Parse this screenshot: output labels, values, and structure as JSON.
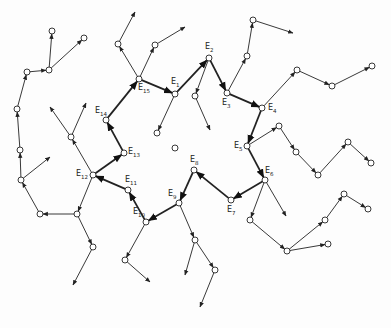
{
  "diagram": {
    "type": "directed-graph",
    "colors": {
      "background": "#fdfdfd",
      "stroke": "#222222",
      "node_fill": "#ffffff"
    },
    "labeled_nodes": [
      {
        "id": "E1",
        "label": "E",
        "sub": "1",
        "x": 175,
        "y": 94,
        "lx": 171,
        "ly": 78
      },
      {
        "id": "E2",
        "label": "E",
        "sub": "2",
        "x": 209,
        "y": 58,
        "lx": 205,
        "ly": 43
      },
      {
        "id": "E3",
        "label": "E",
        "sub": "3",
        "x": 227,
        "y": 93,
        "lx": 222,
        "ly": 99
      },
      {
        "id": "E4",
        "label": "E",
        "sub": "4",
        "x": 262,
        "y": 108,
        "lx": 268,
        "ly": 104
      },
      {
        "id": "E5",
        "label": "E",
        "sub": "5",
        "x": 247,
        "y": 146,
        "lx": 234,
        "ly": 142
      },
      {
        "id": "E6",
        "label": "E",
        "sub": "6",
        "x": 265,
        "y": 180,
        "lx": 265,
        "ly": 167
      },
      {
        "id": "E7",
        "label": "E",
        "sub": "7",
        "x": 231,
        "y": 200,
        "lx": 227,
        "ly": 206
      },
      {
        "id": "E8",
        "label": "E",
        "sub": "8",
        "x": 194,
        "y": 170,
        "lx": 190,
        "ly": 156
      },
      {
        "id": "E9",
        "label": "E",
        "sub": "9",
        "x": 179,
        "y": 203,
        "lx": 168,
        "ly": 190
      },
      {
        "id": "E10",
        "label": "E",
        "sub": "10",
        "x": 146,
        "y": 222,
        "lx": 133,
        "ly": 208
      },
      {
        "id": "E11",
        "label": "E",
        "sub": "11",
        "x": 128,
        "y": 190,
        "lx": 125,
        "ly": 176
      },
      {
        "id": "E12",
        "label": "E",
        "sub": "12",
        "x": 93,
        "y": 175,
        "lx": 76,
        "ly": 170
      },
      {
        "id": "E13",
        "label": "E",
        "sub": "13",
        "x": 124,
        "y": 153,
        "lx": 128,
        "ly": 148
      },
      {
        "id": "E14",
        "label": "E",
        "sub": "14",
        "x": 106,
        "y": 120,
        "lx": 95,
        "ly": 107
      },
      {
        "id": "E15",
        "label": "E",
        "sub": "15",
        "x": 139,
        "y": 79,
        "lx": 138,
        "ly": 84
      }
    ],
    "main_path": [
      "E15",
      "E1",
      "E2",
      "E3",
      "E4",
      "E5",
      "E6",
      "E7",
      "E8",
      "E9",
      "E10",
      "E11",
      "E12",
      "E13",
      "E14",
      "E15"
    ],
    "nodes": [
      [
        118,
        44
      ],
      [
        155,
        45
      ],
      [
        157,
        133
      ],
      [
        195,
        96
      ],
      [
        247,
        56
      ],
      [
        253,
        20
      ],
      [
        297,
        70
      ],
      [
        332,
        86
      ],
      [
        372,
        66
      ],
      [
        279,
        126
      ],
      [
        296,
        152
      ],
      [
        318,
        175
      ],
      [
        348,
        142
      ],
      [
        371,
        163
      ],
      [
        250,
        220
      ],
      [
        287,
        251
      ],
      [
        328,
        244
      ],
      [
        325,
        220
      ],
      [
        344,
        194
      ],
      [
        368,
        209
      ],
      [
        195,
        240
      ],
      [
        215,
        270
      ],
      [
        125,
        260
      ],
      [
        77,
        214
      ],
      [
        93,
        247
      ],
      [
        40,
        214
      ],
      [
        21,
        180
      ],
      [
        20,
        150
      ],
      [
        17,
        109
      ],
      [
        27,
        72
      ],
      [
        49,
        70
      ],
      [
        52,
        31
      ],
      [
        84,
        38
      ],
      [
        71,
        137
      ],
      [
        175,
        148
      ]
    ],
    "thin_edges": [
      [
        139,
        79,
        118,
        44
      ],
      [
        118,
        44,
        135,
        12
      ],
      [
        139,
        79,
        155,
        45
      ],
      [
        155,
        45,
        185,
        27
      ],
      [
        175,
        94,
        157,
        133
      ],
      [
        209,
        58,
        195,
        96
      ],
      [
        195,
        96,
        210,
        130
      ],
      [
        227,
        93,
        247,
        56
      ],
      [
        247,
        56,
        253,
        20
      ],
      [
        253,
        20,
        293,
        33
      ],
      [
        262,
        108,
        297,
        70
      ],
      [
        297,
        70,
        332,
        86
      ],
      [
        332,
        86,
        372,
        66
      ],
      [
        247,
        146,
        279,
        126
      ],
      [
        279,
        126,
        296,
        152
      ],
      [
        296,
        152,
        318,
        175
      ],
      [
        318,
        175,
        348,
        142
      ],
      [
        348,
        142,
        371,
        163
      ],
      [
        265,
        180,
        250,
        220
      ],
      [
        250,
        220,
        287,
        251
      ],
      [
        287,
        251,
        328,
        244
      ],
      [
        287,
        251,
        325,
        220
      ],
      [
        325,
        220,
        344,
        194
      ],
      [
        344,
        194,
        368,
        209
      ],
      [
        265,
        180,
        286,
        216
      ],
      [
        179,
        203,
        195,
        240
      ],
      [
        195,
        240,
        215,
        270
      ],
      [
        215,
        270,
        200,
        307
      ],
      [
        195,
        240,
        185,
        275
      ],
      [
        146,
        222,
        125,
        260
      ],
      [
        125,
        260,
        150,
        282
      ],
      [
        93,
        175,
        77,
        214
      ],
      [
        77,
        214,
        93,
        247
      ],
      [
        93,
        247,
        73,
        285
      ],
      [
        77,
        214,
        40,
        214
      ],
      [
        40,
        214,
        21,
        180
      ],
      [
        21,
        180,
        20,
        150
      ],
      [
        20,
        150,
        17,
        109
      ],
      [
        17,
        109,
        27,
        72
      ],
      [
        27,
        72,
        49,
        70
      ],
      [
        49,
        70,
        52,
        31
      ],
      [
        49,
        70,
        84,
        38
      ],
      [
        21,
        180,
        50,
        157
      ],
      [
        93,
        175,
        71,
        137
      ],
      [
        71,
        137,
        50,
        107
      ],
      [
        71,
        137,
        86,
        103
      ]
    ]
  }
}
